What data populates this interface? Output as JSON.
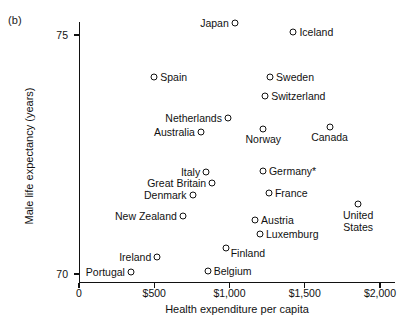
{
  "figure": {
    "panel_label": "(b)"
  },
  "chart_data": {
    "type": "scatter",
    "title": "",
    "xlabel": "Health expenditure per capita",
    "ylabel": "Male life expectancy (years)",
    "xlim": [
      0,
      2100
    ],
    "ylim": [
      69.5,
      75.6
    ],
    "grid": false,
    "legend": "none",
    "xticks": [
      {
        "value": 0,
        "label": "0"
      },
      {
        "value": 500,
        "label": "$500"
      },
      {
        "value": 1000,
        "label": "$1,000"
      },
      {
        "value": 1500,
        "label": "$1,500"
      },
      {
        "value": 2000,
        "label": "$2,000"
      }
    ],
    "yticks": [
      {
        "value": 70,
        "label": "70"
      },
      {
        "value": 75,
        "label": "75"
      }
    ],
    "annotations": [
      "Germany* denotes footnote marker on Germany"
    ],
    "points": [
      {
        "name": "Japan",
        "x": 1035,
        "y": 75.25,
        "label_pos": "left"
      },
      {
        "name": "Iceland",
        "x": 1425,
        "y": 75.06,
        "label_pos": "right"
      },
      {
        "name": "Spain",
        "x": 500,
        "y": 74.12,
        "label_pos": "right"
      },
      {
        "name": "Sweden",
        "x": 1270,
        "y": 74.12,
        "label_pos": "right"
      },
      {
        "name": "Switzerland",
        "x": 1237,
        "y": 73.72,
        "label_pos": "right"
      },
      {
        "name": "Netherlands",
        "x": 990,
        "y": 73.26,
        "label_pos": "left"
      },
      {
        "name": "Australia",
        "x": 810,
        "y": 72.97,
        "label_pos": "left"
      },
      {
        "name": "Norway",
        "x": 1225,
        "y": 73.03,
        "label_pos": "below"
      },
      {
        "name": "Canada",
        "x": 1665,
        "y": 73.07,
        "label_pos": "below"
      },
      {
        "name": "Italy",
        "x": 845,
        "y": 72.13,
        "label_pos": "left"
      },
      {
        "name": "Germany*",
        "x": 1222,
        "y": 72.15,
        "label_pos": "right"
      },
      {
        "name": "Great Britain",
        "x": 885,
        "y": 71.9,
        "label_pos": "left"
      },
      {
        "name": "Denmark",
        "x": 755,
        "y": 71.65,
        "label_pos": "left"
      },
      {
        "name": "France",
        "x": 1262,
        "y": 71.7,
        "label_pos": "right"
      },
      {
        "name": "New Zealand",
        "x": 690,
        "y": 71.22,
        "label_pos": "left"
      },
      {
        "name": "Austria",
        "x": 1170,
        "y": 71.14,
        "label_pos": "right"
      },
      {
        "name": "United States",
        "x": 1855,
        "y": 71.47,
        "label_pos": "below"
      },
      {
        "name": "Luxemburg",
        "x": 1203,
        "y": 70.83,
        "label_pos": "right"
      },
      {
        "name": "Finland",
        "x": 975,
        "y": 70.55,
        "label_pos": "right-low"
      },
      {
        "name": "Ireland",
        "x": 520,
        "y": 70.35,
        "label_pos": "left"
      },
      {
        "name": "Belgium",
        "x": 855,
        "y": 70.07,
        "label_pos": "right"
      },
      {
        "name": "Portugal",
        "x": 345,
        "y": 70.04,
        "label_pos": "left"
      }
    ]
  }
}
